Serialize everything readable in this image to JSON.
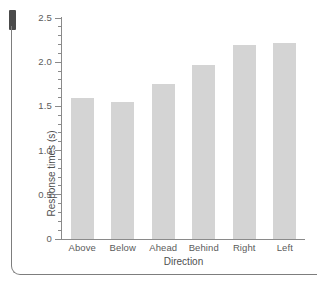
{
  "figure": {
    "artifacts": {
      "scan_edge_name": "scan-gutter-mark",
      "scan_border_name": "scanned-page-border"
    }
  },
  "chart_data": {
    "type": "bar",
    "title": "",
    "xlabel": "Direction",
    "ylabel": "Response times (s)",
    "categories": [
      "Above",
      "Below",
      "Ahead",
      "Behind",
      "Right",
      "Left"
    ],
    "values": [
      1.59,
      1.55,
      1.75,
      1.97,
      2.2,
      2.22
    ],
    "ylim": [
      0,
      2.5
    ],
    "ytick_labels": [
      "0",
      "0.5",
      "1.0",
      "1.5",
      "2.0",
      "2.5"
    ],
    "ytick_values": [
      0,
      0.5,
      1.0,
      1.5,
      2.0,
      2.5
    ],
    "yminor_step": 0.1,
    "grid": false,
    "legend": null,
    "bar_color": "#d4d4d4",
    "axis_color": "#8a8a8a",
    "text_color": "#5b5b5b"
  }
}
